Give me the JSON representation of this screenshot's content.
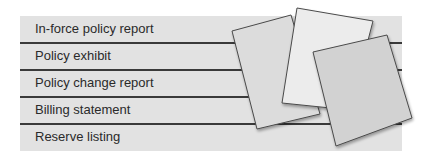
{
  "list": {
    "items": [
      {
        "label": "In-force policy report"
      },
      {
        "label": "Policy exhibit"
      },
      {
        "label": "Policy change report"
      },
      {
        "label": "Billing statement"
      },
      {
        "label": "Reserve listing"
      }
    ]
  },
  "illustration": {
    "icon": "stacked-papers-icon",
    "colors": {
      "band": "#e2e2e2",
      "rule": "#3a3a3a",
      "paper_left": "#dcdcdc",
      "paper_middle": "#ececec",
      "paper_right": "#d2d2d2",
      "paper_edge": "#4a4a4a"
    }
  }
}
